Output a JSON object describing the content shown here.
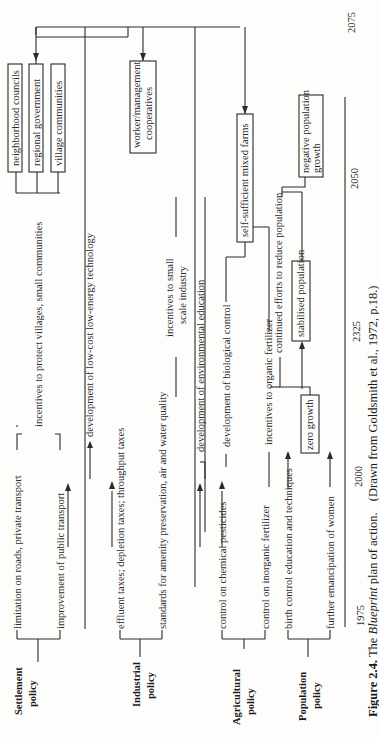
{
  "figure": {
    "number": "Figure 2.4.",
    "caption_pre": "The",
    "caption_italic": "Blueprint",
    "caption_post": "plan of action.",
    "source": "(Drawn from Goldsmith et al., 1972, p.18.)"
  },
  "policies": {
    "settlement": {
      "line1": "Settlement",
      "line2": "policy"
    },
    "industrial": {
      "line1": "Industrial",
      "line2": "policy"
    },
    "agricultural": {
      "line1": "Agricultural",
      "line2": "policy"
    },
    "population": {
      "line1": "Population",
      "line2": "policy"
    }
  },
  "actions": {
    "settlement": [
      "limitation on roads, private transport",
      "improvement of public transport",
      "incentives to protect villages, small communities"
    ],
    "industrial": [
      "effluent taxes; depletion taxes; throughput taxes",
      "standards for amenity preservation, air and water quality",
      "development of low-cost low-energy technology",
      "incentives to small",
      "scale industry"
    ],
    "agricultural": [
      "control on chemical pesticides",
      "control on inorganic fertilizer",
      "development of environmental education",
      "development of biological control",
      "incentives to organic fertilizer"
    ],
    "population": [
      "birth control education and techniques",
      "further emancipation of women",
      "continued efforts to reduce population"
    ]
  },
  "outcomes": {
    "settlement": [
      "neighborhood councils",
      "regional government",
      "village communities"
    ],
    "industrial": [
      "worker/management",
      "cooperatives"
    ],
    "agricultural": "self-sufficient mixed farms",
    "population": [
      "zero growth",
      "stabilised population",
      "negative population",
      "growth"
    ]
  },
  "timeline": [
    "1975",
    "2000",
    "2325",
    "2050",
    "2075"
  ]
}
